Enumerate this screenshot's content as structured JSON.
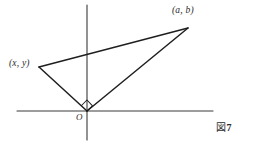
{
  "figure": {
    "caption_label": "図",
    "caption_number": "7",
    "background_color": "#ffffff",
    "ink_color": "#2b2b2b"
  },
  "axes": {
    "origin_label": "O",
    "x_axis": {
      "x1": 17,
      "y1": 111,
      "x2": 213,
      "y2": 111
    },
    "y_axis": {
      "x1": 87,
      "y1": 5,
      "x2": 87,
      "y2": 140
    }
  },
  "triangle": {
    "vertices": [
      {
        "name": "point-xy",
        "label": "(x, y)",
        "x": 39,
        "y": 67
      },
      {
        "name": "point-origin",
        "label": "O",
        "x": 87,
        "y": 111
      },
      {
        "name": "point-ab",
        "label": "(a, b)",
        "x": 188,
        "y": 28
      }
    ],
    "edges": [
      {
        "name": "edge-xy-to-ab",
        "from": "point-xy",
        "to": "point-ab"
      },
      {
        "name": "edge-xy-to-origin",
        "from": "point-xy",
        "to": "point-origin"
      },
      {
        "name": "edge-origin-to-ab",
        "from": "point-origin",
        "to": "point-ab"
      }
    ],
    "right_angle_at": "point-origin"
  },
  "labels": {
    "point_ab": "(a, b)",
    "point_xy": "(x, y)",
    "origin": "O"
  }
}
